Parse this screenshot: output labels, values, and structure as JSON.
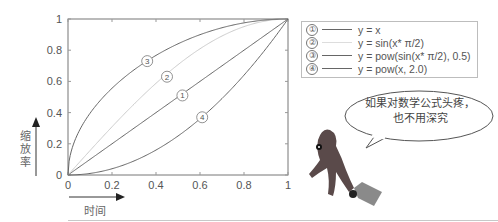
{
  "chart_data": {
    "type": "line",
    "title": "",
    "xlabel": "时间",
    "ylabel": "缩放率",
    "xlim": [
      0,
      1
    ],
    "ylim": [
      0,
      1
    ],
    "grid": false,
    "legend_position": "upper-right-outside",
    "x_ticks": [
      "0",
      "0.2",
      "0.4",
      "0.6",
      "0.8",
      "1"
    ],
    "y_ticks": [
      "0",
      "0.2",
      "0.4",
      "0.6",
      "0.8",
      "1"
    ],
    "x": [
      0,
      0.1,
      0.2,
      0.3,
      0.4,
      0.5,
      0.6,
      0.7,
      0.8,
      0.9,
      1.0
    ],
    "series": [
      {
        "id": 1,
        "name": "y = x",
        "color": "#666666",
        "values": [
          0,
          0.1,
          0.2,
          0.3,
          0.4,
          0.5,
          0.6,
          0.7,
          0.8,
          0.9,
          1.0
        ]
      },
      {
        "id": 2,
        "name": "y = sin(x* π/2)",
        "color": "#cccccc",
        "values": [
          0,
          0.156,
          0.309,
          0.454,
          0.588,
          0.707,
          0.809,
          0.891,
          0.951,
          0.988,
          1.0
        ]
      },
      {
        "id": 3,
        "name": "y = pow(sin(x* π/2), 0.5)",
        "color": "#666666",
        "values": [
          0,
          0.395,
          0.556,
          0.674,
          0.767,
          0.841,
          0.899,
          0.944,
          0.975,
          0.994,
          1.0
        ]
      },
      {
        "id": 4,
        "name": "y = pow(x, 2.0)",
        "color": "#666666",
        "values": [
          0,
          0.01,
          0.04,
          0.09,
          0.16,
          0.25,
          0.36,
          0.49,
          0.64,
          0.81,
          1.0
        ]
      }
    ],
    "annotations": [
      {
        "label": "③",
        "x": 0.36,
        "y": 0.73
      },
      {
        "label": "②",
        "x": 0.45,
        "y": 0.63
      },
      {
        "label": "①",
        "x": 0.52,
        "y": 0.51
      },
      {
        "label": "④",
        "x": 0.61,
        "y": 0.37
      }
    ]
  },
  "legend": {
    "items": [
      {
        "num": "①",
        "text": "y = x"
      },
      {
        "num": "②",
        "text": "y = sin(x* π/2)"
      },
      {
        "num": "③",
        "text": "y = pow(sin(x* π/2), 0.5)"
      },
      {
        "num": "④",
        "text": "y = pow(x, 2.0)"
      }
    ]
  },
  "axes": {
    "y_label_chars": [
      "缩",
      "放",
      "率"
    ],
    "x_label": "时间"
  },
  "bubble": {
    "line1": "如果对数学公式头疼，",
    "line2": "也不用深究"
  }
}
